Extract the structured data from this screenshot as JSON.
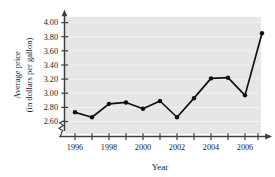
{
  "chart_data": {
    "type": "line",
    "title": "",
    "xlabel": "Year",
    "ylabel": "Average price (in dollars per gallon)",
    "ylabel_line1": "Average price",
    "ylabel_line2": "(in dollars per gallon)",
    "x": [
      1996,
      1997,
      1998,
      1999,
      2000,
      2001,
      2002,
      2003,
      2004,
      2005,
      2006,
      2007
    ],
    "values": [
      2.73,
      2.66,
      2.85,
      2.87,
      2.78,
      2.89,
      2.66,
      2.93,
      3.21,
      3.22,
      2.97,
      3.85
    ],
    "categories": [
      "1996",
      "1997",
      "1998",
      "1999",
      "2000",
      "2001",
      "2002",
      "2003",
      "2004",
      "2005",
      "2006",
      "2007"
    ],
    "xtick_labels": [
      "1996",
      "",
      "1998",
      "",
      "2000",
      "",
      "2002",
      "",
      "2004",
      "",
      "2006",
      ""
    ],
    "ytick_labels": [
      "2.60",
      "2.80",
      "3.00",
      "3.20",
      "3.40",
      "3.60",
      "3.80",
      "4.00"
    ],
    "ytick_values": [
      2.6,
      2.8,
      3.0,
      3.2,
      3.4,
      3.6,
      3.8,
      4.0
    ],
    "ylim": [
      2.5,
      4.08
    ],
    "xlim": [
      1995.3,
      2007.6
    ],
    "grid": true,
    "grid_axis": "y",
    "axis_break": true,
    "legend": "none",
    "marker": "circle",
    "plot_background": "#e6e6e6",
    "grid_color": "#f2f2f2",
    "line_color": "#111111",
    "axis_color": "#4a4a4a"
  }
}
